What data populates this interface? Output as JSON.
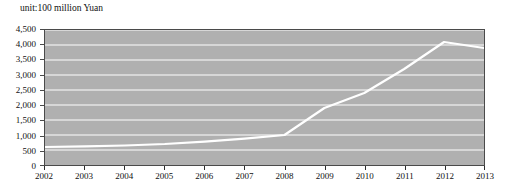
{
  "chart_data": {
    "type": "line",
    "title": "",
    "subtitle": "unit:100 million Yuan",
    "xlabel": "",
    "ylabel": "",
    "categories": [
      "2002",
      "2003",
      "2004",
      "2005",
      "2006",
      "2007",
      "2008",
      "2009",
      "2010",
      "2011",
      "2012",
      "2013"
    ],
    "x": [
      2002,
      2003,
      2004,
      2005,
      2006,
      2007,
      2008,
      2009,
      2010,
      2011,
      2012,
      2013
    ],
    "values": [
      600,
      620,
      650,
      700,
      780,
      880,
      1000,
      1900,
      2400,
      3200,
      4100,
      3900
    ],
    "series": [
      {
        "name": "",
        "values": [
          600,
          620,
          650,
          700,
          780,
          880,
          1000,
          1900,
          2400,
          3200,
          4100,
          3900
        ],
        "color": "#ffffff"
      }
    ],
    "ylim": [
      0,
      4500
    ],
    "xlim": [
      2002,
      2013
    ],
    "ytick_values": [
      0,
      500,
      1000,
      1500,
      2000,
      2500,
      3000,
      3500,
      4000,
      4500
    ],
    "ytick_labels": [
      "0",
      "500",
      "1,000",
      "1,500",
      "2,000",
      "2,500",
      "3,000",
      "3,500",
      "4,000",
      "4,500"
    ],
    "xtick_labels": [
      "2002",
      "2003",
      "2004",
      "2005",
      "2006",
      "2007",
      "2008",
      "2009",
      "2010",
      "2011",
      "2012",
      "2013"
    ],
    "grid": true,
    "grid_color": "#ffffff",
    "legend": false,
    "legend_position": "none",
    "plot_background": "#b0b0b0",
    "figure_background": "#ffffff",
    "axis_color": "#4a4a4a",
    "text_color": "#111111"
  }
}
